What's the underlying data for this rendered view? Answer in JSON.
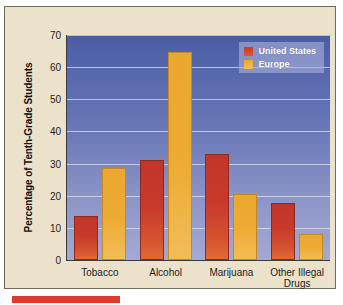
{
  "chart_data": {
    "type": "bar",
    "title": "",
    "xlabel": "",
    "ylabel": "Percentage of Tenth-Grade Students",
    "ylim": [
      0,
      70
    ],
    "yticks": [
      0,
      10,
      20,
      30,
      40,
      50,
      60,
      70
    ],
    "grid": true,
    "legend_position": "top-right",
    "categories": [
      "Tobacco",
      "Alcohol",
      "Marijuana",
      "Other Illegal\nDrugs"
    ],
    "series": [
      {
        "name": "United States",
        "color": "#c8392b",
        "values": [
          13,
          30.5,
          32.5,
          17
        ]
      },
      {
        "name": "Europe",
        "color": "#eba72f",
        "values": [
          28,
          64,
          20,
          7.5
        ]
      }
    ]
  },
  "axis": {
    "ticks": [
      {
        "label": "70",
        "value": 70
      },
      {
        "label": "60",
        "value": 60
      },
      {
        "label": "50",
        "value": 50
      },
      {
        "label": "40",
        "value": 40
      },
      {
        "label": "30",
        "value": 30
      },
      {
        "label": "20",
        "value": 20
      },
      {
        "label": "10",
        "value": 10
      },
      {
        "label": "0",
        "value": 0
      }
    ],
    "y_title": "Percentage of Tenth-Grade Students"
  },
  "legend": {
    "items": [
      {
        "label": "United States"
      },
      {
        "label": "Europe"
      }
    ]
  },
  "colors": {
    "series_us": "#c8392b",
    "series_eu": "#eba72f",
    "plot_bg_top": "#4a5da4",
    "plot_bg_bottom": "#a3a9d4",
    "card_bg": "#ece2cb",
    "caption_rule": "#e03a2f"
  }
}
